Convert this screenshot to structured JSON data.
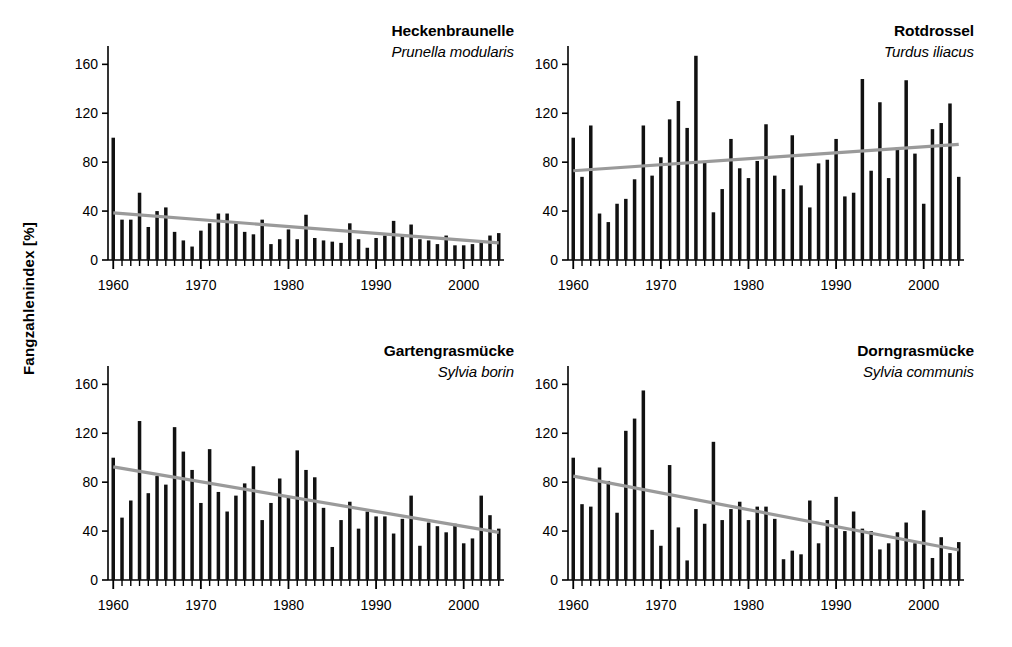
{
  "figure": {
    "ylabel": "Fangzahlenindex  [%]",
    "background": "#ffffff",
    "bar_color": "#111111",
    "trend_color": "#9a9a9a",
    "axis_color": "#000000"
  },
  "chart_data": [
    {
      "type": "bar",
      "panel_index": 0,
      "title": "Heckenbraunelle",
      "subtitle": "Prunella modularis",
      "xlabel": "",
      "ylabel": "Fangzahlenindex [%]",
      "xlim": [
        1959.4,
        2004.6
      ],
      "ylim": [
        0,
        175
      ],
      "ytick_values": [
        0,
        40,
        80,
        120,
        160
      ],
      "ytick_labels": [
        "0",
        "40",
        "80",
        "120",
        "160"
      ],
      "xtick_values": [
        1960,
        1970,
        1980,
        1990,
        2000
      ],
      "xtick_labels": [
        "1960",
        "1970",
        "1980",
        "1990",
        "2000"
      ],
      "grid": false,
      "legend": "none",
      "x": [
        1960,
        1961,
        1962,
        1963,
        1964,
        1965,
        1966,
        1967,
        1968,
        1969,
        1970,
        1971,
        1972,
        1973,
        1974,
        1975,
        1976,
        1977,
        1978,
        1979,
        1980,
        1981,
        1982,
        1983,
        1984,
        1985,
        1986,
        1987,
        1988,
        1989,
        1990,
        1991,
        1992,
        1993,
        1994,
        1995,
        1996,
        1997,
        1998,
        1999,
        2000,
        2001,
        2002,
        2003,
        2004
      ],
      "values": [
        100,
        33,
        33,
        55,
        27,
        40,
        43,
        23,
        16,
        11,
        24,
        30,
        38,
        38,
        30,
        23,
        21,
        33,
        13,
        17,
        25,
        17,
        37,
        18,
        16,
        15,
        14,
        30,
        17,
        10,
        18,
        20,
        32,
        21,
        29,
        17,
        16,
        13,
        20,
        12,
        12,
        13,
        16,
        20,
        22
      ],
      "trend": {
        "x": [
          1960,
          2004
        ],
        "y": [
          38.5,
          14.0
        ]
      }
    },
    {
      "type": "bar",
      "panel_index": 1,
      "title": "Rotdrossel",
      "subtitle": "Turdus iliacus",
      "xlabel": "",
      "ylabel": "Fangzahlenindex [%]",
      "xlim": [
        1959.4,
        2004.6
      ],
      "ylim": [
        0,
        175
      ],
      "ytick_values": [
        0,
        40,
        80,
        120,
        160
      ],
      "ytick_labels": [
        "0",
        "40",
        "80",
        "120",
        "160"
      ],
      "xtick_values": [
        1960,
        1970,
        1980,
        1990,
        2000
      ],
      "xtick_labels": [
        "1960",
        "1970",
        "1980",
        "1990",
        "2000"
      ],
      "grid": false,
      "legend": "none",
      "x": [
        1960,
        1961,
        1962,
        1963,
        1964,
        1965,
        1966,
        1967,
        1968,
        1969,
        1970,
        1971,
        1972,
        1973,
        1974,
        1975,
        1976,
        1977,
        1978,
        1979,
        1980,
        1981,
        1982,
        1983,
        1984,
        1985,
        1986,
        1987,
        1988,
        1989,
        1990,
        1991,
        1992,
        1993,
        1994,
        1995,
        1996,
        1997,
        1998,
        1999,
        2000,
        2001,
        2002,
        2003,
        2004
      ],
      "values": [
        100,
        68,
        110,
        38,
        31,
        46,
        50,
        66,
        110,
        69,
        84,
        115,
        130,
        108,
        167,
        81,
        39,
        58,
        99,
        75,
        67,
        81,
        111,
        69,
        58,
        102,
        61,
        43,
        79,
        82,
        99,
        52,
        55,
        148,
        73,
        129,
        67,
        92,
        147,
        87,
        46,
        107,
        112,
        128,
        68
      ],
      "trend": {
        "x": [
          1960,
          2004
        ],
        "y": [
          73.0,
          94.5
        ]
      }
    },
    {
      "type": "bar",
      "panel_index": 2,
      "title": "Gartengrasmücke",
      "subtitle": "Sylvia borin",
      "xlabel": "",
      "ylabel": "Fangzahlenindex [%]",
      "xlim": [
        1959.4,
        2004.6
      ],
      "ylim": [
        0,
        175
      ],
      "ytick_values": [
        0,
        40,
        80,
        120,
        160
      ],
      "ytick_labels": [
        "0",
        "40",
        "80",
        "120",
        "160"
      ],
      "xtick_values": [
        1960,
        1970,
        1980,
        1990,
        2000
      ],
      "xtick_labels": [
        "1960",
        "1970",
        "1980",
        "1990",
        "2000"
      ],
      "grid": false,
      "legend": "none",
      "x": [
        1960,
        1961,
        1962,
        1963,
        1964,
        1965,
        1966,
        1967,
        1968,
        1969,
        1970,
        1971,
        1972,
        1973,
        1974,
        1975,
        1976,
        1977,
        1978,
        1979,
        1980,
        1981,
        1982,
        1983,
        1984,
        1985,
        1986,
        1987,
        1988,
        1989,
        1990,
        1991,
        1992,
        1993,
        1994,
        1995,
        1996,
        1997,
        1998,
        1999,
        2000,
        2001,
        2002,
        2003,
        2004
      ],
      "values": [
        100,
        51,
        65,
        130,
        71,
        85,
        78,
        125,
        105,
        90,
        63,
        107,
        72,
        56,
        69,
        79,
        93,
        49,
        63,
        83,
        68,
        106,
        90,
        84,
        59,
        27,
        49,
        64,
        42,
        56,
        52,
        52,
        38,
        50,
        69,
        28,
        47,
        44,
        39,
        46,
        30,
        34,
        69,
        53,
        42
      ],
      "trend": {
        "x": [
          1960,
          2004
        ],
        "y": [
          92.5,
          39.0
        ]
      }
    },
    {
      "type": "bar",
      "panel_index": 3,
      "title": "Dorngrasmücke",
      "subtitle": "Sylvia communis",
      "xlabel": "",
      "ylabel": "Fangzahlenindex [%]",
      "xlim": [
        1959.4,
        2004.6
      ],
      "ylim": [
        0,
        175
      ],
      "ytick_values": [
        0,
        40,
        80,
        120,
        160
      ],
      "ytick_labels": [
        "0",
        "40",
        "80",
        "120",
        "160"
      ],
      "xtick_values": [
        1960,
        1970,
        1980,
        1990,
        2000
      ],
      "xtick_labels": [
        "1960",
        "1970",
        "1980",
        "1990",
        "2000"
      ],
      "grid": false,
      "legend": "none",
      "x": [
        1960,
        1961,
        1962,
        1963,
        1964,
        1965,
        1966,
        1967,
        1968,
        1969,
        1970,
        1971,
        1972,
        1973,
        1974,
        1975,
        1976,
        1977,
        1978,
        1979,
        1980,
        1981,
        1982,
        1983,
        1984,
        1985,
        1986,
        1987,
        1988,
        1989,
        1990,
        1991,
        1992,
        1993,
        1994,
        1995,
        1996,
        1997,
        1998,
        1999,
        2000,
        2001,
        2002,
        2003,
        2004
      ],
      "values": [
        100,
        62,
        60,
        92,
        81,
        55,
        122,
        132,
        155,
        41,
        28,
        94,
        43,
        16,
        58,
        46,
        113,
        49,
        58,
        64,
        49,
        60,
        60,
        50,
        17,
        24,
        21,
        65,
        30,
        49,
        68,
        40,
        56,
        42,
        40,
        25,
        30,
        39,
        47,
        30,
        57,
        18,
        35,
        22,
        31
      ],
      "trend": {
        "x": [
          1960,
          2004
        ],
        "y": [
          85.0,
          24.5
        ]
      }
    }
  ]
}
